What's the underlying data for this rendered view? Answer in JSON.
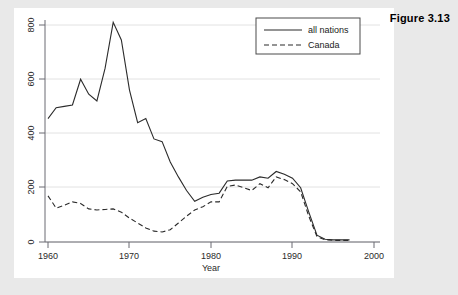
{
  "figure": {
    "title": "Figure 3.13"
  },
  "chart_data": {
    "type": "line",
    "title": "",
    "xlabel": "Year",
    "ylabel": "",
    "xlim": [
      1960,
      2000
    ],
    "ylim": [
      0,
      850
    ],
    "xticks": [
      1960,
      1970,
      1980,
      1990,
      2000
    ],
    "yticks": [
      0,
      200,
      400,
      600,
      800
    ],
    "grid": true,
    "legend_position": "top-right",
    "x": [
      1960,
      1961,
      1962,
      1963,
      1964,
      1965,
      1966,
      1967,
      1968,
      1969,
      1970,
      1971,
      1972,
      1973,
      1974,
      1975,
      1976,
      1977,
      1978,
      1979,
      1980,
      1981,
      1982,
      1983,
      1984,
      1985,
      1986,
      1987,
      1988,
      1989,
      1990,
      1991,
      1992,
      1993,
      1994,
      1995,
      1996,
      1997
    ],
    "series": [
      {
        "name": "all nations",
        "style": "solid",
        "color": "#2b2b2b",
        "values": [
          455,
          495,
          500,
          505,
          600,
          545,
          520,
          640,
          810,
          745,
          560,
          440,
          455,
          380,
          370,
          295,
          240,
          190,
          150,
          165,
          175,
          180,
          225,
          228,
          228,
          228,
          240,
          235,
          260,
          250,
          235,
          200,
          110,
          25,
          10,
          8,
          8,
          8
        ]
      },
      {
        "name": "Canada",
        "style": "dashed",
        "color": "#2b2b2b",
        "values": [
          170,
          125,
          135,
          148,
          142,
          122,
          118,
          120,
          122,
          110,
          88,
          70,
          52,
          40,
          37,
          45,
          70,
          95,
          118,
          130,
          148,
          148,
          205,
          210,
          200,
          190,
          215,
          200,
          240,
          230,
          215,
          185,
          95,
          20,
          8,
          6,
          6,
          6
        ]
      }
    ]
  },
  "legend": {
    "items": [
      {
        "label": "all nations",
        "style": "solid"
      },
      {
        "label": "Canada",
        "style": "dashed"
      }
    ]
  },
  "axis": {
    "x_title": "Year",
    "x_tick_labels": [
      "1960",
      "1970",
      "1980",
      "1990",
      "2000"
    ],
    "y_tick_labels": [
      "0",
      "200",
      "400",
      "600",
      "800"
    ]
  }
}
